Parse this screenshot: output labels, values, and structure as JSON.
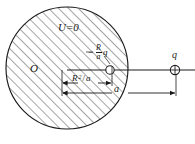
{
  "figure": {
    "type": "physics-diagram",
    "colors": {
      "stroke": "#1a1a1a",
      "hatch": "#2b2b2b",
      "background": "#ffffff"
    },
    "sphere": {
      "center_x": 67,
      "center_y": 68,
      "radius": 61,
      "hatched": true,
      "hatch_angle_deg": 45,
      "hatch_spacing_px": 7,
      "potential_label": "U=0"
    },
    "origin": {
      "label": "O",
      "x": 67,
      "y": 70
    },
    "image_charge": {
      "label_minus": "−",
      "numerator": "R",
      "denominator": "a",
      "charge_symbol": "q",
      "full_label": "−(R/a)q",
      "x": 110,
      "y": 70,
      "marker": "open-circle"
    },
    "real_charge": {
      "label": "q",
      "sign": "+",
      "x": 175,
      "y": 70,
      "marker": "circle-plus"
    },
    "dimensions": [
      {
        "name": "image-distance",
        "base": "R",
        "exponent": "2",
        "slash": "/",
        "divisor": "a",
        "label": "R²/a",
        "from_x": 62,
        "to_x": 112,
        "y": 83
      },
      {
        "name": "charge-distance",
        "label": "a",
        "from_x": 62,
        "to_x": 176,
        "y": 93
      }
    ],
    "axis": {
      "y": 70,
      "from_x": 67,
      "to_x": 195
    }
  }
}
